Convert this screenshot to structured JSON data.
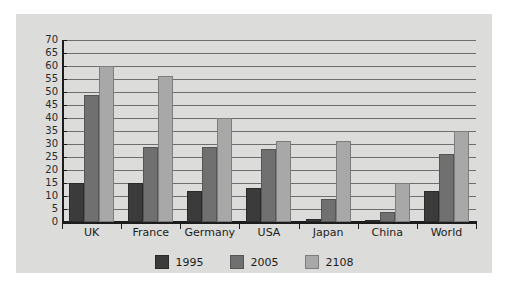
{
  "chart_data": {
    "type": "bar",
    "title": "",
    "xlabel": "",
    "ylabel": "",
    "categories": [
      "UK",
      "France",
      "Germany",
      "USA",
      "Japan",
      "China",
      "World"
    ],
    "series": [
      {
        "name": "1995",
        "color": "#3b3b3b",
        "values": [
          15,
          15,
          12,
          13,
          1,
          0,
          12
        ]
      },
      {
        "name": "2005",
        "color": "#707070",
        "values": [
          49,
          29,
          29,
          28,
          9,
          4,
          26
        ]
      },
      {
        "name": "2108",
        "color": "#a8a8a8",
        "values": [
          60,
          56,
          40,
          31,
          31,
          15,
          35
        ]
      }
    ],
    "ylim": [
      0,
      70
    ],
    "ytick_step": 5,
    "yticks": [
      70,
      65,
      60,
      55,
      50,
      45,
      40,
      35,
      30,
      25,
      20,
      15,
      10,
      5,
      0
    ],
    "grid": true,
    "legend_position": "bottom"
  },
  "colors": {
    "page_background": "#ffffff",
    "card_background": "#dcdcda",
    "gridline": "#6e6e6e",
    "axis": "#1c1c1c",
    "text": "#1c1c1c"
  }
}
